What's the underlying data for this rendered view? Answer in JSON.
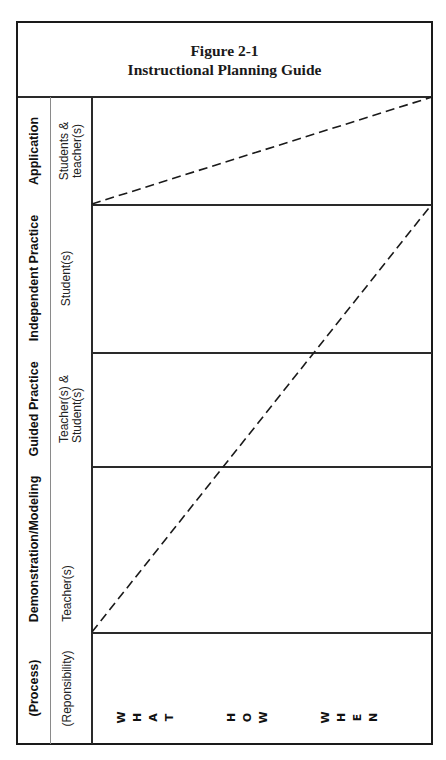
{
  "figure": {
    "number": "Figure 2-1",
    "title": "Instructional Planning Guide"
  },
  "row_headers": {
    "process": "(Process)",
    "responsibility": "(Reponsibility)"
  },
  "stages": [
    {
      "name": "Demonstration/Modeling",
      "responsibility": [
        "Teacher(s)"
      ]
    },
    {
      "name": "Guided Practice",
      "responsibility": [
        "Teacher(s) &",
        "Student(s)"
      ]
    },
    {
      "name": "Independent Practice",
      "responsibility": [
        "Student(s)"
      ]
    },
    {
      "name": "Application",
      "responsibility": [
        "Students &",
        "teacher(s)"
      ]
    }
  ],
  "columns": {
    "what": [
      "W",
      "H",
      "A",
      "T"
    ],
    "how": [
      "H",
      "O",
      "W"
    ],
    "when": [
      "W",
      "H",
      "E",
      "N"
    ]
  },
  "colors": {
    "line": "#1a1a1a",
    "thin_line": "#8a8a8a",
    "background": "#ffffff"
  }
}
